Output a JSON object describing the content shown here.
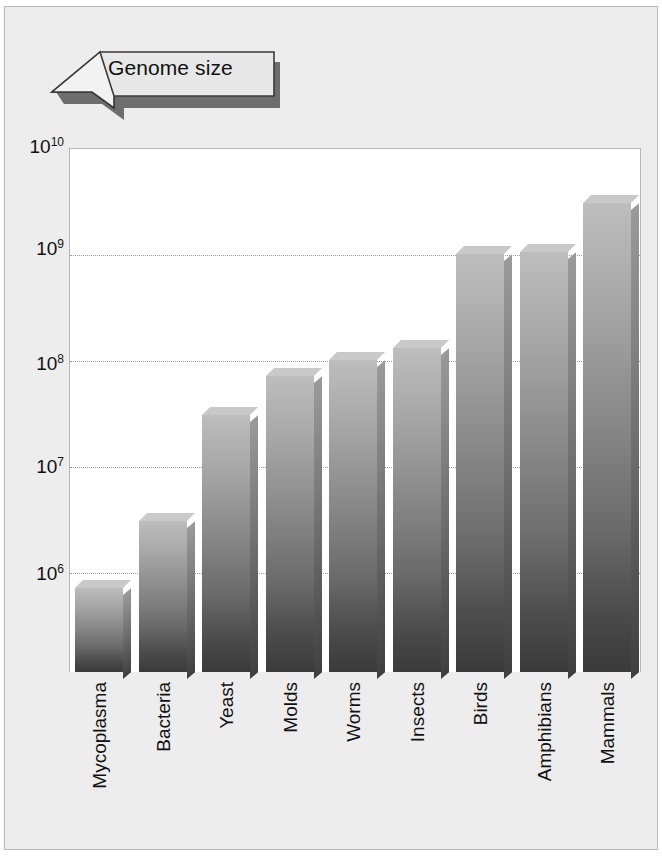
{
  "callout": {
    "label": "Genome size",
    "icon": "arrow-banner-icon"
  },
  "chart_data": {
    "type": "bar",
    "title": "Genome size",
    "xlabel": "",
    "ylabel": "",
    "yscale": "log",
    "ylim": [
      100000,
      10000000000
    ],
    "grid": true,
    "legend": false,
    "categories": [
      "Mycoplasma",
      "Bacteria",
      "Yeast",
      "Molds",
      "Worms",
      "Insects",
      "Birds",
      "Amphibians",
      "Mammals"
    ],
    "values": [
      700000,
      3000000,
      30000000,
      70000000,
      100000000,
      130000000,
      1000000000,
      1050000000,
      3000000000
    ],
    "ytick_values": [
      10000000000,
      1000000000,
      100000000,
      10000000,
      1000000
    ],
    "ytick_labels": [
      "10¹⁰",
      "10⁹",
      "10⁸",
      "10⁷",
      "10⁶"
    ],
    "ytick_bases": [
      "10",
      "10",
      "10",
      "10",
      "10"
    ],
    "ytick_exponents": [
      "10",
      "9",
      "8",
      "7",
      "6"
    ]
  },
  "colors": {
    "page_background": "#ededed",
    "plot_background": "#ffffff",
    "bar_top": "#c9c9c9",
    "bar_bottom": "#3a3a3a",
    "gridline": "#9a9a9a",
    "text": "#111111",
    "callout_fill": "#e8e8e8",
    "callout_shadow": "#6e6e6e"
  }
}
